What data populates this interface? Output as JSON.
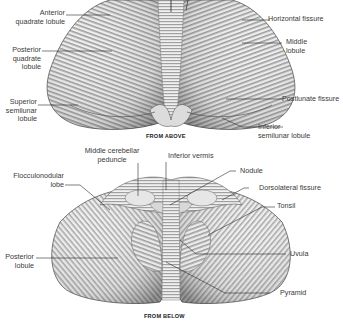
{
  "figure_top": {
    "caption": "FROM ABOVE",
    "labels": [
      {
        "id": "anterior-quadrate-lobule",
        "text": "Anterior\nquadrate lobule",
        "side": "left"
      },
      {
        "id": "posterior-quadrate-lobule",
        "text": "Posterior\nquadrate\nlobule",
        "side": "left"
      },
      {
        "id": "superior-semilunar-lobule",
        "text": "Superior\nsemilunar\nlobule",
        "side": "left"
      },
      {
        "id": "horizontal-fissure",
        "text": "Horizontal fissure",
        "side": "right"
      },
      {
        "id": "middle-lobule",
        "text": "Middle\nlobule",
        "side": "right"
      },
      {
        "id": "postlunate-fissure",
        "text": "Postlunate fissure",
        "side": "right"
      },
      {
        "id": "inferior-semilunar-lobule",
        "text": "Inferior\nsemilunar lobule",
        "side": "right"
      }
    ]
  },
  "figure_bottom": {
    "caption": "FROM BELOW",
    "labels": [
      {
        "id": "middle-cerebellar-peduncle",
        "text": "Middle cerebellar\npeduncle",
        "side": "top"
      },
      {
        "id": "inferior-vermis",
        "text": "Inferior vermis",
        "side": "top"
      },
      {
        "id": "flocculonodular-lobe",
        "text": "Flocculonodular\nlobe",
        "side": "left"
      },
      {
        "id": "posterior-lobule",
        "text": "Posterior\nlobule",
        "side": "left"
      },
      {
        "id": "nodule",
        "text": "Nodule",
        "side": "right"
      },
      {
        "id": "dorsolateral-fissure",
        "text": "Dorsolateral fissure",
        "side": "right"
      },
      {
        "id": "tonsil",
        "text": "Tonsil",
        "side": "right"
      },
      {
        "id": "uvula",
        "text": "Uvula",
        "side": "right"
      },
      {
        "id": "pyramid",
        "text": "Pyramid",
        "side": "right"
      }
    ]
  },
  "colors": {
    "background": "#ffffff",
    "label_text": "#3a3a3a",
    "leader_line": "#2a2a2a",
    "tissue_light": "#f2f2f2",
    "tissue_dark": "#8a8a8a"
  }
}
